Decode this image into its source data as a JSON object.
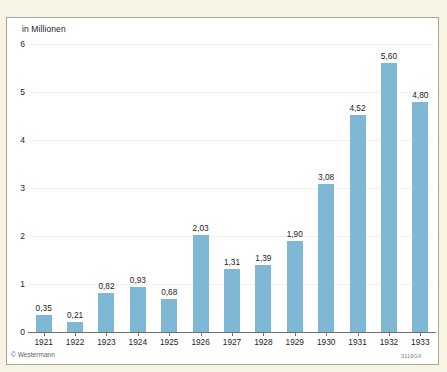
{
  "figure": {
    "background_color": "#f7f4e4",
    "panel_color": "#ffffff",
    "border_color": "#a8a698",
    "bar_color": "#7fb8d4",
    "axis_color": "#6f6f6f",
    "copyright": "© Westermann",
    "plate_code": "3119GX"
  },
  "chart_data": {
    "type": "bar",
    "title": "",
    "subtitle": "",
    "xlabel": "",
    "ylabel": "in Millionen",
    "ylim": [
      0,
      6
    ],
    "yticks": [
      0,
      1,
      2,
      3,
      4,
      5,
      6
    ],
    "ytick_labels": [
      "0",
      "1",
      "2",
      "3",
      "4",
      "5",
      "6"
    ],
    "grid": true,
    "legend": null,
    "categories": [
      "1921",
      "1922",
      "1923",
      "1924",
      "1925",
      "1926",
      "1927",
      "1928",
      "1929",
      "1930",
      "1931",
      "1932",
      "1933"
    ],
    "values": [
      0.35,
      0.21,
      0.82,
      0.93,
      0.68,
      2.03,
      1.31,
      1.39,
      1.9,
      3.08,
      4.52,
      5.6,
      4.8
    ],
    "value_labels": [
      "0,35",
      "0,21",
      "0,82",
      "0,93",
      "0,68",
      "2,03",
      "1,31",
      "1,39",
      "1,90",
      "3,08",
      "4,52",
      "5,60",
      "4,80"
    ]
  }
}
